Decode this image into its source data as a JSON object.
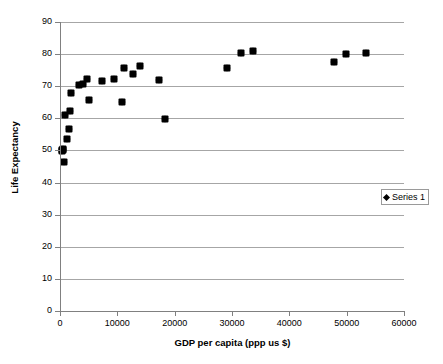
{
  "chart_data": {
    "type": "scatter",
    "title": "",
    "xlabel": "GDP per capita (ppp us $)",
    "ylabel": "Life Expectancy",
    "xlim": [
      0,
      60000
    ],
    "ylim": [
      0,
      90
    ],
    "xticks": [
      0,
      10000,
      20000,
      30000,
      40000,
      50000,
      60000
    ],
    "xtick_labels": [
      "0",
      "10000",
      "20000",
      "30000",
      "40000",
      "50000",
      "60000"
    ],
    "yticks": [
      0,
      10,
      20,
      30,
      40,
      50,
      60,
      70,
      80,
      90
    ],
    "ytick_labels": [
      "0",
      "10",
      "20",
      "30",
      "40",
      "50",
      "60",
      "70",
      "80",
      "90"
    ],
    "grid": "horizontal",
    "legend_position": "right",
    "marker": "diamond",
    "marker_color": "#000000",
    "gridline_color": "#a6a6a6",
    "axis_color": "#808080",
    "series": [
      {
        "name": "Series 1",
        "points": [
          [
            350,
            50.2
          ],
          [
            420,
            49.8
          ],
          [
            500,
            50.4
          ],
          [
            600,
            50.0
          ],
          [
            700,
            46.5
          ],
          [
            900,
            61.0
          ],
          [
            1200,
            53.7
          ],
          [
            1500,
            56.6
          ],
          [
            1700,
            62.4
          ],
          [
            1900,
            67.8
          ],
          [
            3400,
            70.5
          ],
          [
            4000,
            70.6
          ],
          [
            4700,
            72.4
          ],
          [
            5000,
            65.7
          ],
          [
            7400,
            71.6
          ],
          [
            9400,
            72.1
          ],
          [
            10800,
            65.1
          ],
          [
            11100,
            75.7
          ],
          [
            12800,
            73.9
          ],
          [
            13900,
            76.3
          ],
          [
            17200,
            71.8
          ],
          [
            18300,
            59.8
          ],
          [
            29200,
            75.6
          ],
          [
            31500,
            80.5
          ],
          [
            33600,
            81.0
          ],
          [
            47800,
            77.6
          ],
          [
            49800,
            80.0
          ],
          [
            53400,
            80.5
          ]
        ]
      }
    ]
  },
  "legend": {
    "series_label": "Series 1"
  }
}
